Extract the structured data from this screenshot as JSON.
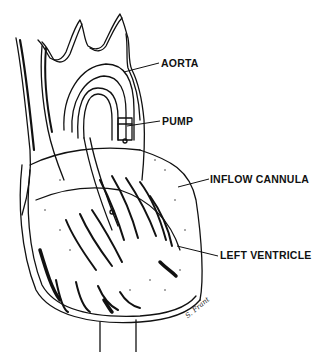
{
  "figure": {
    "labels": {
      "aorta": "AORTA",
      "pump": "PUMP",
      "inflow_cannula": "INFLOW CANNULA",
      "left_ventricle": "LEFT VENTRICLE"
    },
    "signature": "S. Frant",
    "colors": {
      "ink": "#111111",
      "background": "#ffffff"
    }
  }
}
